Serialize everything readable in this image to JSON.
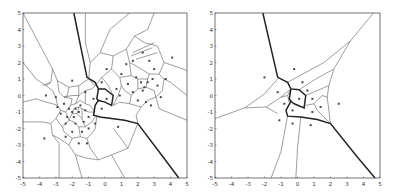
{
  "figure": {
    "panels": [
      {
        "id": "left",
        "description": "Voronoi diagram of many sites with bold boundary edges"
      },
      {
        "id": "right",
        "description": "Voronoi diagram of few sites with bold boundary edges"
      }
    ]
  },
  "chart_data": [
    {
      "type": "scatter",
      "title": "",
      "xlabel": "",
      "ylabel": "",
      "xlim": [
        -5,
        5
      ],
      "ylim": [
        -5,
        5
      ],
      "xticks": [
        "-5",
        "-4",
        "-3",
        "-2",
        "-1",
        "0",
        "1",
        "2",
        "3",
        "4",
        "5"
      ],
      "yticks": [
        "5",
        "4",
        "3",
        "2",
        "1",
        "0",
        "-1",
        "-2",
        "-3",
        "-4",
        "-5"
      ],
      "grid": false,
      "points": [
        [
          -2.0,
          0.9
        ],
        [
          -3.6,
          0.0
        ],
        [
          -3.0,
          -0.1
        ],
        [
          -2.5,
          -0.5
        ],
        [
          -2.2,
          -0.8
        ],
        [
          -2.0,
          -1.0
        ],
        [
          -1.8,
          -0.8
        ],
        [
          -1.6,
          -1.0
        ],
        [
          -1.9,
          -1.3
        ],
        [
          -2.3,
          -1.3
        ],
        [
          -1.5,
          -0.6
        ],
        [
          -1.2,
          -0.9
        ],
        [
          -1.0,
          -1.3
        ],
        [
          -1.3,
          -1.6
        ],
        [
          -1.8,
          -1.7
        ],
        [
          -2.4,
          -1.7
        ],
        [
          -2.7,
          -1.1
        ],
        [
          -2.9,
          -0.7
        ],
        [
          -2.0,
          -2.2
        ],
        [
          -1.4,
          -2.2
        ],
        [
          -3.7,
          -2.6
        ],
        [
          -2.4,
          -2.5
        ],
        [
          -1.6,
          -2.9
        ],
        [
          -1.1,
          -2.9
        ],
        [
          -1.0,
          -2.0
        ],
        [
          -0.6,
          -1.7
        ],
        [
          -1.2,
          0.2
        ],
        [
          -0.7,
          -0.2
        ],
        [
          0.1,
          -0.2
        ],
        [
          -0.2,
          -0.8
        ],
        [
          -0.2,
          0.8
        ],
        [
          0.1,
          1.6
        ],
        [
          0.7,
          0.4
        ],
        [
          1.0,
          1.3
        ],
        [
          0.9,
          0.0
        ],
        [
          1.4,
          0.7
        ],
        [
          1.7,
          0.2
        ],
        [
          1.9,
          1.1
        ],
        [
          2.2,
          0.8
        ],
        [
          2.4,
          0.5
        ],
        [
          2.6,
          0.8
        ],
        [
          2.3,
          0.3
        ],
        [
          2.0,
          -0.3
        ],
        [
          2.5,
          -0.4
        ],
        [
          2.9,
          1.0
        ],
        [
          3.2,
          0.6
        ],
        [
          3.4,
          -0.1
        ],
        [
          3.0,
          1.6
        ],
        [
          2.3,
          2.6
        ],
        [
          2.7,
          2.1
        ],
        [
          1.7,
          2.1
        ],
        [
          2.8,
          -0.6
        ],
        [
          3.7,
          1.0
        ],
        [
          4.1,
          2.3
        ],
        [
          1.3,
          1.9
        ],
        [
          0.8,
          -1.9
        ]
      ]
    },
    {
      "type": "scatter",
      "title": "",
      "xlabel": "",
      "ylabel": "",
      "xlim": [
        -5,
        5
      ],
      "ylim": [
        -5,
        5
      ],
      "xticks": [
        "-5",
        "-4",
        "-3",
        "-2",
        "-1",
        "0",
        "1",
        "2",
        "3",
        "4",
        "5"
      ],
      "yticks": [
        "5",
        "4",
        "3",
        "2",
        "1",
        "0",
        "-1",
        "-2",
        "-3",
        "-4",
        "-5"
      ],
      "grid": false,
      "points": [
        [
          -2.0,
          1.1
        ],
        [
          -0.2,
          1.6
        ],
        [
          0.3,
          0.8
        ],
        [
          0.6,
          0.3
        ],
        [
          -1.2,
          0.2
        ],
        [
          0.1,
          -0.2
        ],
        [
          -0.8,
          -0.5
        ],
        [
          0.9,
          -0.2
        ],
        [
          1.4,
          -0.7
        ],
        [
          -0.3,
          -0.9
        ],
        [
          0.9,
          -1.0
        ],
        [
          2.5,
          -0.5
        ],
        [
          -1.1,
          -1.5
        ],
        [
          -0.3,
          -1.7
        ],
        [
          0.8,
          -1.8
        ]
      ]
    }
  ]
}
